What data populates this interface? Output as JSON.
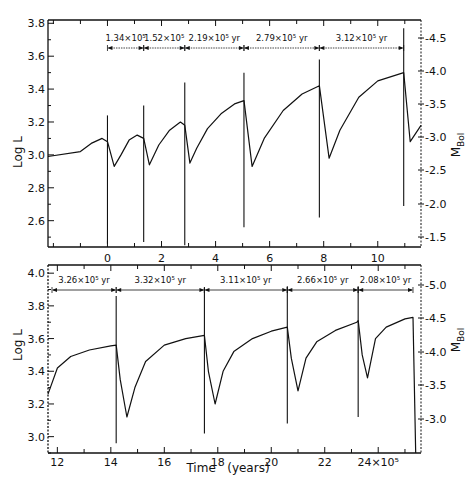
{
  "chart_data": [
    {
      "type": "line",
      "panel": "top",
      "title": "",
      "xlabel": "",
      "ylabel": "Log L",
      "ylabel_right": "M_Bol",
      "xlim": [
        -2.2,
        11.6
      ],
      "ylim": [
        2.44,
        3.82
      ],
      "x_ticks": [
        0,
        2,
        4,
        6,
        8,
        10
      ],
      "x_tick_labels": [
        "0",
        "2",
        "4",
        "6",
        "8",
        "10"
      ],
      "y_ticks": [
        2.6,
        2.8,
        3.0,
        3.2,
        3.4,
        3.6,
        3.8
      ],
      "y_tick_labels": [
        "2.6",
        "2.8",
        "3.0",
        "3.2",
        "3.4",
        "3.6",
        "3.8"
      ],
      "right_ticks": [
        "-1.5",
        "-2.0",
        "-2.5",
        "-3.0",
        "-3.5",
        "-4.0",
        "-4.5"
      ],
      "grid": false,
      "annotations": [
        {
          "label": "1.34×10⁵",
          "x_start": 0.0,
          "x_end": 1.34
        },
        {
          "label": "1.52×10⁵",
          "x_start": 1.34,
          "x_end": 2.86
        },
        {
          "label": "2.19×10⁵ yr",
          "x_start": 2.86,
          "x_end": 5.05
        },
        {
          "label": "2.79×10⁵ yr",
          "x_start": 5.05,
          "x_end": 7.84
        },
        {
          "label": "3.12×10⁵ yr",
          "x_start": 7.84,
          "x_end": 10.96
        }
      ],
      "pulses": [
        {
          "t": 0.0,
          "pre_max": 3.1,
          "spike_high": 3.24,
          "spike_low": 2.46,
          "dip_min": 2.92
        },
        {
          "t": 1.34,
          "pre_max": 3.13,
          "spike_high": 3.3,
          "spike_low": 2.47,
          "dip_min": 2.94
        },
        {
          "t": 2.86,
          "pre_max": 3.2,
          "spike_high": 3.44,
          "spike_low": 2.45,
          "dip_min": 2.95
        },
        {
          "t": 5.05,
          "pre_max": 3.33,
          "spike_high": 3.5,
          "spike_low": 2.56,
          "dip_min": 2.93
        },
        {
          "t": 7.84,
          "pre_max": 3.42,
          "spike_high": 3.58,
          "spike_low": 2.62,
          "dip_min": 2.97
        },
        {
          "t": 10.96,
          "pre_max": 3.5,
          "spike_high": 3.77,
          "spike_low": 2.69,
          "dip_min": 3.09
        }
      ],
      "series": [
        {
          "name": "Log L",
          "x": [
            -2.2,
            -1.0,
            -0.6,
            -0.2,
            0.0,
            0.25,
            0.5,
            0.8,
            1.1,
            1.34,
            1.55,
            1.9,
            2.3,
            2.7,
            2.86,
            3.05,
            3.3,
            3.7,
            4.2,
            4.7,
            5.05,
            5.35,
            5.8,
            6.5,
            7.2,
            7.84,
            8.2,
            8.6,
            9.3,
            10.0,
            10.96,
            11.2,
            11.6
          ],
          "values": [
            2.99,
            3.02,
            3.07,
            3.1,
            3.08,
            2.93,
            3.0,
            3.09,
            3.12,
            3.1,
            2.94,
            3.06,
            3.15,
            3.2,
            3.18,
            2.95,
            3.04,
            3.16,
            3.25,
            3.31,
            3.33,
            2.93,
            3.1,
            3.27,
            3.37,
            3.42,
            2.98,
            3.15,
            3.35,
            3.45,
            3.5,
            3.08,
            3.18
          ]
        }
      ]
    },
    {
      "type": "line",
      "panel": "bottom",
      "title": "",
      "xlabel": "Time (years)",
      "x_scale_label": "×10⁵",
      "ylabel": "Log L",
      "ylabel_right": "M_Bol",
      "xlim": [
        11.65,
        25.6
      ],
      "ylim": [
        2.9,
        4.05
      ],
      "x_ticks": [
        12,
        14,
        16,
        18,
        20,
        22,
        24
      ],
      "x_tick_labels": [
        "12",
        "14",
        "16",
        "18",
        "20",
        "22",
        "24×10⁵"
      ],
      "y_ticks": [
        3.0,
        3.2,
        3.4,
        3.6,
        3.8,
        4.0
      ],
      "y_tick_labels": [
        "3.0",
        "3.2",
        "3.4",
        "3.6",
        "3.8",
        "4.0"
      ],
      "right_ticks": [
        "-3.0",
        "-3.5",
        "-4.0",
        "-4.5",
        "-5.0"
      ],
      "grid": false,
      "annotations": [
        {
          "label": "3.26×10⁵ yr",
          "x_start": 11.65,
          "x_end": 14.2
        },
        {
          "label": "3.32×10⁵ yr",
          "x_start": 14.2,
          "x_end": 17.5
        },
        {
          "label": "3.11×10⁵ yr",
          "x_start": 17.5,
          "x_end": 20.6
        },
        {
          "label": "2.66×10⁵ yr",
          "x_start": 20.6,
          "x_end": 23.25
        },
        {
          "label": "2.08×10⁵ yr",
          "x_start": 23.25,
          "x_end": 25.3
        }
      ],
      "pulses": [
        {
          "t": 14.2,
          "pre_max": 3.56,
          "spike_high": 3.86,
          "spike_low": 2.96,
          "dip_min": 3.12
        },
        {
          "t": 17.5,
          "pre_max": 3.62,
          "spike_high": 3.91,
          "spike_low": 3.02,
          "dip_min": 3.2
        },
        {
          "t": 20.6,
          "pre_max": 3.67,
          "spike_high": 3.92,
          "spike_low": 3.08,
          "dip_min": 3.28
        },
        {
          "t": 23.25,
          "pre_max": 3.71,
          "spike_high": 3.92,
          "spike_low": 3.12,
          "dip_min": 3.36
        }
      ],
      "series": [
        {
          "name": "Log L",
          "x": [
            11.65,
            12.0,
            12.5,
            13.2,
            14.0,
            14.2,
            14.35,
            14.6,
            14.9,
            15.3,
            16.0,
            16.8,
            17.5,
            17.65,
            17.9,
            18.2,
            18.6,
            19.3,
            20.0,
            20.6,
            20.75,
            21.0,
            21.3,
            21.7,
            22.4,
            23.2,
            23.25,
            23.4,
            23.6,
            23.9,
            24.3,
            25.0,
            25.3,
            25.4
          ],
          "values": [
            3.26,
            3.42,
            3.49,
            3.53,
            3.555,
            3.56,
            3.35,
            3.12,
            3.3,
            3.46,
            3.56,
            3.6,
            3.62,
            3.4,
            3.2,
            3.4,
            3.52,
            3.6,
            3.645,
            3.67,
            3.48,
            3.28,
            3.48,
            3.58,
            3.65,
            3.7,
            3.71,
            3.5,
            3.36,
            3.6,
            3.67,
            3.72,
            3.73,
            2.9
          ]
        }
      ]
    }
  ],
  "labels": {
    "top_ylabel": "Log L",
    "bottom_ylabel": "Log L",
    "right_ylabel_main": "M",
    "right_ylabel_sub": "Bol",
    "xlabel": "Time   (years)"
  }
}
